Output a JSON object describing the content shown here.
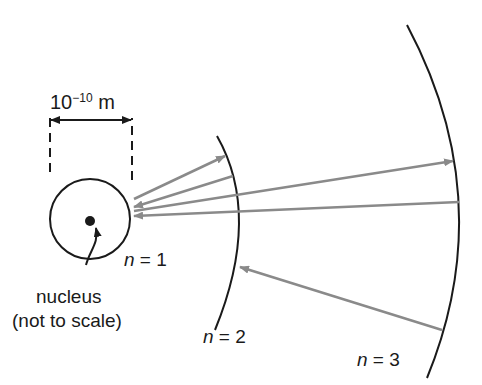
{
  "scale_label": {
    "base": "10",
    "exponent": "−10",
    "unit": " m"
  },
  "orbits": [
    {
      "name": "n",
      "eq": " = 1"
    },
    {
      "name": "n",
      "eq": " = 2"
    },
    {
      "name": "n",
      "eq": " = 3"
    }
  ],
  "nucleus_label": {
    "line1": "nucleus",
    "line2": "(not to scale)"
  },
  "colors": {
    "line": "#1a1a1a",
    "arrow": "#8a8a8a"
  }
}
